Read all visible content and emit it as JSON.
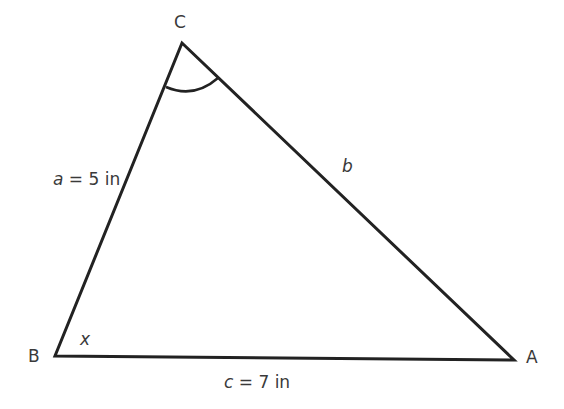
{
  "diagram": {
    "type": "triangle",
    "vertices": {
      "A": {
        "label": "A"
      },
      "B": {
        "label": "B"
      },
      "C": {
        "label": "C"
      }
    },
    "sides": {
      "a": {
        "var": "a",
        "eq": " = 5 in"
      },
      "b": {
        "var": "b"
      },
      "c": {
        "var": "c",
        "eq": " = 7 in"
      }
    },
    "angle_B_label": "x",
    "angle_C_marked": true,
    "line_color": "#222222",
    "text_color": "#3a3a3a"
  }
}
